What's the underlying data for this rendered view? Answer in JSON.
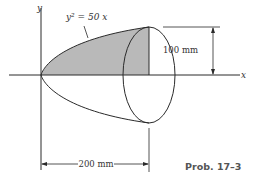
{
  "figure": {
    "equation": "y² = 50 x",
    "axis_y_label": "y",
    "axis_x_label": "x",
    "height_dimension": "100 mm",
    "length_dimension": "200 mm",
    "caption": "Prob. 17–3"
  },
  "colors": {
    "shaded_region": "#b9b9b9",
    "lines": "#2a2a2a"
  }
}
